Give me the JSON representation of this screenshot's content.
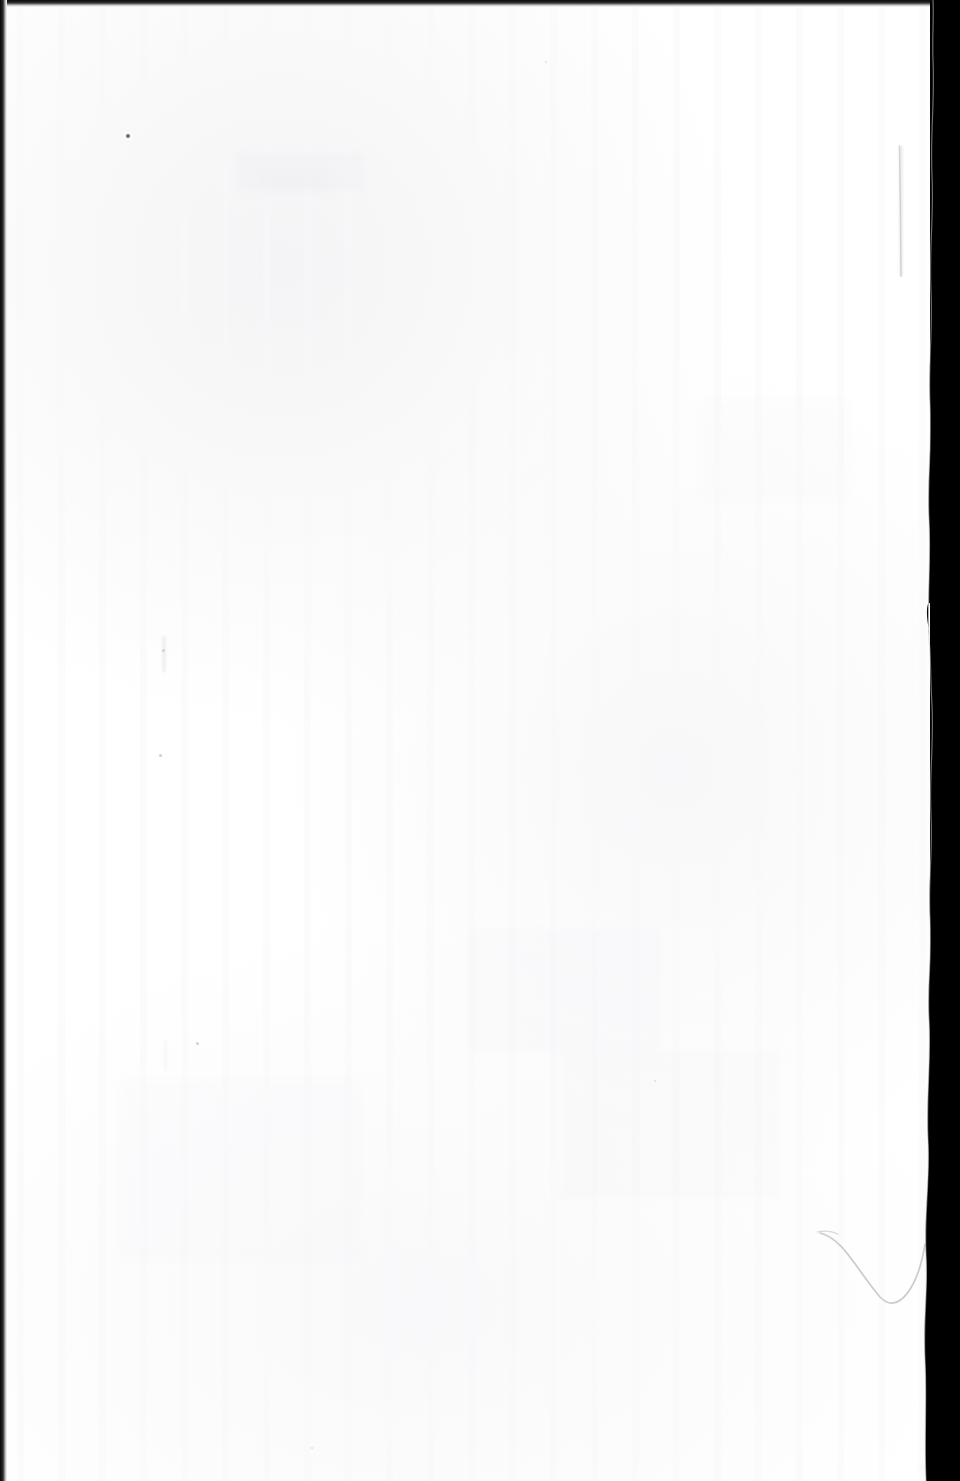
{
  "document": {
    "kind": "scanned-page-image",
    "page_type": "blank page",
    "visible_text": "",
    "description": "Blank scanned book page with no printed text; near-white paper with faint show-through ghosting, scattered specks, and two faint pencil marks.",
    "orientation": "portrait",
    "width_px": 960,
    "height_px": 1481
  },
  "colors": {
    "paper": "#ffffff",
    "paper_shade": "#f6f6f8",
    "scanner_void": "#000000",
    "edge_band": "#0a0a0a",
    "pencil_mark": "#cfcfd4",
    "speck": "#8d8d93",
    "showthrough": "#ebebef"
  },
  "paper_edges": {
    "top_band_height_px": 7,
    "left_band_width_px": 7,
    "right_void_start_px": 932,
    "right_void_width_px": 30
  },
  "marks": {
    "pencil_vertical_line": {
      "name": "faint vertical pencil line",
      "x_px": 900,
      "y_start_px": 146,
      "y_end_px": 276
    },
    "pencil_curve": {
      "name": "faint curved pencil stroke",
      "x_start_px": 820,
      "y_start_px": 1233,
      "x_low_px": 880,
      "y_low_px": 1303,
      "x_end_px": 925,
      "y_end_px": 1244
    },
    "specks": [
      {
        "name": "dark speck upper left",
        "x_px": 128,
        "y_px": 136,
        "size_px": 4
      },
      {
        "name": "faint speck mid left",
        "x_px": 163,
        "y_px": 650,
        "size_px": 3
      },
      {
        "name": "faint speck left lower",
        "x_px": 160,
        "y_px": 755,
        "size_px": 3
      },
      {
        "name": "faint speck left bottom",
        "x_px": 197,
        "y_px": 1043,
        "size_px": 3
      },
      {
        "name": "faint speck centre",
        "x_px": 546,
        "y_px": 62,
        "size_px": 2
      },
      {
        "name": "faint speck right",
        "x_px": 655,
        "y_px": 1081,
        "size_px": 2
      },
      {
        "name": "faint speck lower centre",
        "x_px": 312,
        "y_px": 1448,
        "size_px": 2
      }
    ],
    "torn_flap": {
      "name": "torn paper flap on right edge",
      "x_px": 931,
      "y_px": 600,
      "height_px": 38
    }
  }
}
